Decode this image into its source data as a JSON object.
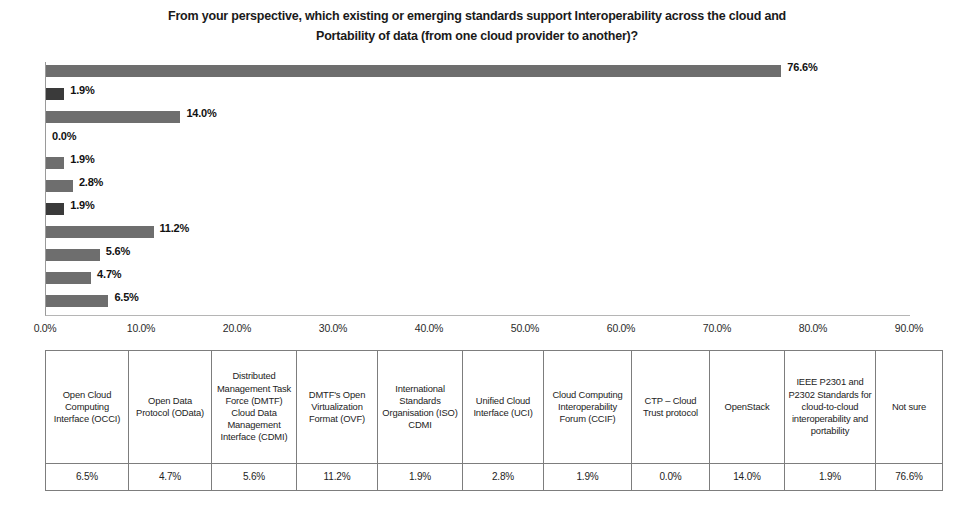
{
  "title": {
    "line1": "From your perspective, which existing or emerging standards support Interoperability across the cloud and",
    "line2": "Portability of data (from one cloud provider to another)?"
  },
  "chart_data": {
    "type": "bar",
    "orientation": "horizontal",
    "title": "From your perspective, which existing or emerging standards support Interoperability across the cloud and Portability of data (from one cloud provider to another)?",
    "xlabel": "",
    "ylabel": "",
    "xlim": [
      0,
      90
    ],
    "xticks": [
      "0.0%",
      "10.0%",
      "20.0%",
      "30.0%",
      "40.0%",
      "50.0%",
      "60.0%",
      "70.0%",
      "80.0%",
      "90.0%"
    ],
    "xtick_values": [
      0,
      10,
      20,
      30,
      40,
      50,
      60,
      70,
      80,
      90
    ],
    "grid": false,
    "legend": false,
    "categories": [
      "Open Cloud Computing Interface (OCCI)",
      "Open Data Protocol (OData)",
      "Distributed Management Task Force (DMTF) Cloud Data Management Interface (CDMI)",
      "DMTF's Open Virtualization Format (OVF)",
      "International Standards Organisation (ISO) CDMI",
      "Unified Cloud Interface (UCI)",
      "Cloud Computing Interoperability Forum (CCIF)",
      "CTP - Cloud Trust protocol",
      "OpenStack",
      "IEEE P2301 and P2302 Standards for cloud-to-cloud interoperability and portability",
      "Not sure"
    ],
    "values": [
      6.5,
      4.7,
      5.6,
      11.2,
      1.9,
      2.8,
      1.9,
      0.0,
      14.0,
      1.9,
      76.6
    ],
    "value_labels": [
      "6.5%",
      "4.7%",
      "5.6%",
      "11.2%",
      "1.9%",
      "2.8%",
      "1.9%",
      "0.0%",
      "14.0%",
      "1.9%",
      "76.6%"
    ]
  },
  "bars": [
    {
      "value": 76.6,
      "label": "76.6%",
      "shade": "mid"
    },
    {
      "value": 1.9,
      "label": "1.9%",
      "shade": "dark"
    },
    {
      "value": 14.0,
      "label": "14.0%",
      "shade": "mid"
    },
    {
      "value": 0.0,
      "label": "0.0%",
      "shade": "mid"
    },
    {
      "value": 1.9,
      "label": "1.9%",
      "shade": "mid"
    },
    {
      "value": 2.8,
      "label": "2.8%",
      "shade": "mid"
    },
    {
      "value": 1.9,
      "label": "1.9%",
      "shade": "dark"
    },
    {
      "value": 11.2,
      "label": "11.2%",
      "shade": "mid"
    },
    {
      "value": 5.6,
      "label": "5.6%",
      "shade": "mid"
    },
    {
      "value": 4.7,
      "label": "4.7%",
      "shade": "mid"
    },
    {
      "value": 6.5,
      "label": "6.5%",
      "shade": "mid"
    }
  ],
  "x_axis": {
    "ticks": [
      "0.0%",
      "10.0%",
      "20.0%",
      "30.0%",
      "40.0%",
      "50.0%",
      "60.0%",
      "70.0%",
      "80.0%",
      "90.0%"
    ]
  },
  "table": {
    "headers": [
      "Open Cloud Computing Interface (OCCI)",
      "Open Data Protocol (OData)",
      "Distributed Management Task Force (DMTF) Cloud Data Management Interface (CDMI)",
      "DMTF's Open Virtualization Format (OVF)",
      "International Standards Organisation (ISO) CDMI",
      "Unified Cloud Interface (UCI)",
      "Cloud Computing Interoperability Forum (CCIF)",
      "CTP – Cloud Trust protocol",
      "OpenStack",
      "IEEE P2301 and P2302 Standards for cloud-to-cloud interoperability and portability",
      "Not sure"
    ],
    "values": [
      "6.5%",
      "4.7%",
      "5.6%",
      "11.2%",
      "1.9%",
      "2.8%",
      "1.9%",
      "0.0%",
      "14.0%",
      "1.9%",
      "76.6%"
    ]
  },
  "colors": {
    "bar_default": "#8c8c8c",
    "bar_dark": "#3a3a3a",
    "axis": "#9a9a9a",
    "table_border": "#7d7d7d",
    "text": "#1b1b1b"
  }
}
